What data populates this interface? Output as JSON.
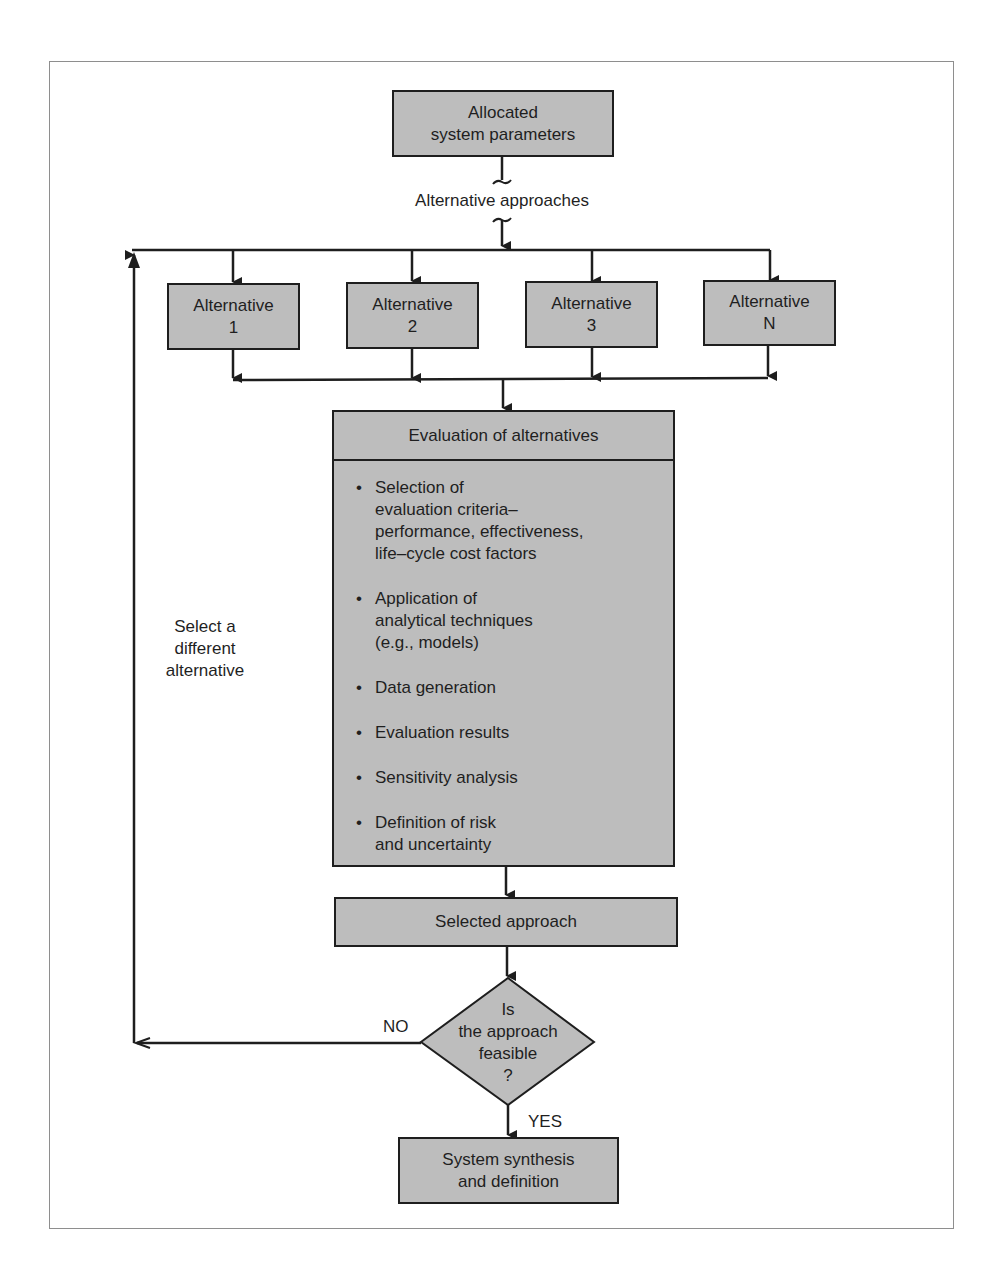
{
  "diagram": {
    "type": "flowchart",
    "start": {
      "label_line1": "Allocated",
      "label_line2": "system parameters"
    },
    "branch_label": "Alternative approaches",
    "alternatives": [
      {
        "line1": "Alternative",
        "line2": "1"
      },
      {
        "line1": "Alternative",
        "line2": "2"
      },
      {
        "line1": "Alternative",
        "line2": "3"
      },
      {
        "line1": "Alternative",
        "line2": "N"
      }
    ],
    "evaluation": {
      "title": "Evaluation of alternatives",
      "bullet": "•",
      "items": [
        "Selection of\nevaluation criteria–\nperformance, effectiveness,\nlife–cycle cost factors",
        "Application of\nanalytical techniques\n(e.g., models)",
        "Data generation",
        "Evaluation results",
        "Sensitivity analysis",
        "Definition of risk\nand uncertainty"
      ]
    },
    "selected": "Selected approach",
    "decision": "Is\nthe approach\nfeasible\n?",
    "no_label": "NO",
    "yes_label": "YES",
    "loop_label_line1": "Select a",
    "loop_label_line2": "different",
    "loop_label_line3": "alternative",
    "end": {
      "label_line1": "System synthesis",
      "label_line2": "and definition"
    },
    "colors": {
      "box_fill": "#bdbdbd",
      "line": "#1e1e1e",
      "frame": "#8e8e8e"
    }
  }
}
